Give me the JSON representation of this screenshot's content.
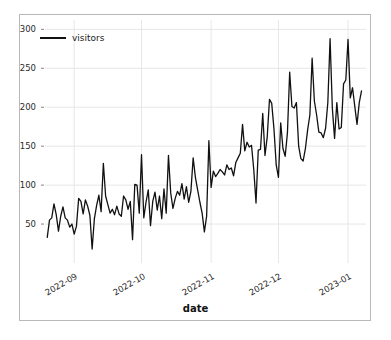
{
  "chart_data": {
    "type": "line",
    "title": "",
    "xlabel": "date",
    "ylabel": "",
    "grid": true,
    "legend_position": "upper left",
    "ylim": [
      0,
      312
    ],
    "ytick_values": [
      50,
      100,
      150,
      200,
      250,
      300
    ],
    "ytick_labels": [
      "50",
      "100",
      "150",
      "200",
      "250",
      "300"
    ],
    "xtick_labels": [
      "2022-09",
      "2022-10",
      "2022-11",
      "2022-12",
      "2023-01"
    ],
    "xtick_dates": [
      "2022-09-01",
      "2022-10-01",
      "2022-11-01",
      "2022-12-01",
      "2023-01-01"
    ],
    "xlim": [
      "2022-08-19",
      "2023-01-09"
    ],
    "line_color": "#111111",
    "line_width": 1.3,
    "series": [
      {
        "name": "visitors",
        "x": [
          "2022-08-20",
          "2022-08-21",
          "2022-08-22",
          "2022-08-23",
          "2022-08-24",
          "2022-08-25",
          "2022-08-26",
          "2022-08-27",
          "2022-08-28",
          "2022-08-29",
          "2022-08-30",
          "2022-08-31",
          "2022-09-01",
          "2022-09-02",
          "2022-09-03",
          "2022-09-04",
          "2022-09-05",
          "2022-09-06",
          "2022-09-07",
          "2022-09-08",
          "2022-09-09",
          "2022-09-10",
          "2022-09-11",
          "2022-09-12",
          "2022-09-13",
          "2022-09-14",
          "2022-09-15",
          "2022-09-16",
          "2022-09-17",
          "2022-09-18",
          "2022-09-19",
          "2022-09-20",
          "2022-09-21",
          "2022-09-22",
          "2022-09-23",
          "2022-09-24",
          "2022-09-25",
          "2022-09-26",
          "2022-09-27",
          "2022-09-28",
          "2022-09-29",
          "2022-09-30",
          "2022-10-01",
          "2022-10-02",
          "2022-10-03",
          "2022-10-04",
          "2022-10-05",
          "2022-10-06",
          "2022-10-07",
          "2022-10-08",
          "2022-10-09",
          "2022-10-10",
          "2022-10-11",
          "2022-10-12",
          "2022-10-13",
          "2022-10-14",
          "2022-10-15",
          "2022-10-16",
          "2022-10-17",
          "2022-10-18",
          "2022-10-19",
          "2022-10-20",
          "2022-10-21",
          "2022-10-22",
          "2022-10-23",
          "2022-10-24",
          "2022-10-25",
          "2022-10-26",
          "2022-10-27",
          "2022-10-28",
          "2022-10-29",
          "2022-10-30",
          "2022-10-31",
          "2022-11-01",
          "2022-11-02",
          "2022-11-03",
          "2022-11-04",
          "2022-11-05",
          "2022-11-06",
          "2022-11-07",
          "2022-11-08",
          "2022-11-09",
          "2022-11-10",
          "2022-11-11",
          "2022-11-12",
          "2022-11-13",
          "2022-11-14",
          "2022-11-15",
          "2022-11-16",
          "2022-11-17",
          "2022-11-18",
          "2022-11-19",
          "2022-11-20",
          "2022-11-21",
          "2022-11-22",
          "2022-11-23",
          "2022-11-24",
          "2022-11-25",
          "2022-11-26",
          "2022-11-27",
          "2022-11-28",
          "2022-11-29",
          "2022-11-30",
          "2022-12-01",
          "2022-12-02",
          "2022-12-03",
          "2022-12-04",
          "2022-12-05",
          "2022-12-06",
          "2022-12-07",
          "2022-12-08",
          "2022-12-09",
          "2022-12-10",
          "2022-12-11",
          "2022-12-12",
          "2022-12-13",
          "2022-12-14",
          "2022-12-15",
          "2022-12-16",
          "2022-12-17",
          "2022-12-18",
          "2022-12-19",
          "2022-12-20",
          "2022-12-21",
          "2022-12-22",
          "2022-12-23",
          "2022-12-24",
          "2022-12-25",
          "2022-12-26",
          "2022-12-27",
          "2022-12-28",
          "2022-12-29",
          "2022-12-30",
          "2022-12-31",
          "2023-01-01",
          "2023-01-02",
          "2023-01-03",
          "2023-01-04",
          "2023-01-05",
          "2023-01-06",
          "2023-01-07"
        ],
        "values": [
          33,
          55,
          58,
          76,
          62,
          41,
          60,
          72,
          58,
          55,
          46,
          50,
          37,
          47,
          83,
          79,
          63,
          81,
          73,
          61,
          18,
          57,
          74,
          87,
          66,
          128,
          86,
          75,
          64,
          69,
          62,
          73,
          63,
          60,
          86,
          81,
          69,
          79,
          30,
          101,
          100,
          64,
          139,
          58,
          78,
          94,
          48,
          79,
          91,
          68,
          86,
          57,
          95,
          64,
          138,
          90,
          70,
          83,
          92,
          87,
          102,
          82,
          98,
          78,
          92,
          135,
          110,
          94,
          78,
          64,
          40,
          60,
          157,
          97,
          118,
          111,
          115,
          120,
          117,
          113,
          126,
          120,
          122,
          112,
          129,
          135,
          141,
          178,
          144,
          155,
          149,
          151,
          120,
          77,
          145,
          146,
          192,
          138,
          162,
          210,
          205,
          172,
          126,
          110,
          180,
          147,
          137,
          167,
          245,
          201,
          199,
          206,
          150,
          134,
          131,
          147,
          171,
          190,
          263,
          208,
          190,
          168,
          167,
          161,
          173,
          206,
          288,
          199,
          160,
          206,
          172,
          174,
          230,
          235,
          287,
          212,
          225,
          201,
          178,
          206,
          221
        ]
      }
    ]
  },
  "axis": {
    "ylabel_text": "",
    "xlabel_text": "date"
  },
  "legend": {
    "entries": [
      {
        "label": "visitors",
        "color": "#111111"
      }
    ]
  }
}
